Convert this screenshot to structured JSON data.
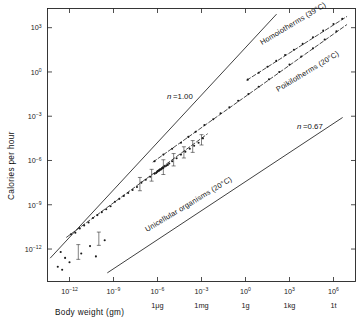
{
  "figure": {
    "name": "metabolic-rate-vs-body-weight-log-log-plot",
    "background_color": "#ffffff",
    "ink_color": "#1a1a1a"
  },
  "axes": {
    "x_title": "Body weight (gm)",
    "y_title": "Calories per hour",
    "x_tick_labels": [
      "10-12",
      "10-9",
      "10-6",
      "10-3",
      "100",
      "103",
      "106"
    ],
    "x_unit_labels": [
      "",
      "",
      "1μg",
      "1mg",
      "1g",
      "1kg",
      "1t"
    ],
    "y_tick_labels": [
      "103",
      "100",
      "10-3",
      "10-6",
      "10-9",
      "10-12"
    ]
  },
  "annotations": {
    "homoiotherms": "Homoiotherms (39°C)",
    "poikilotherms": "Poikilotherms (20°C)",
    "unicellular": "Unicellular organisms (20°C)",
    "slope_upper": "n =1.00",
    "slope_lower": "n =0.67"
  },
  "chart_data": {
    "type": "scatter",
    "title": "",
    "xlabel": "Body weight (gm)",
    "ylabel": "Calories per hour",
    "xscale": "log10",
    "yscale": "log10",
    "xlim": [
      -13.5,
      7.5
    ],
    "ylim": [
      -14.2,
      4.3
    ],
    "grid": false,
    "legend": "inline-annotations",
    "x_ticks": [
      -12,
      -9,
      -6,
      -3,
      0,
      3,
      6
    ],
    "x_tick_text": [
      "10^-12",
      "10^-9",
      "10^-6",
      "10^-3",
      "10^0",
      "10^3",
      "10^6"
    ],
    "x_secondary_text": [
      "",
      "",
      "1μg",
      "1mg",
      "1g",
      "1kg",
      "1t"
    ],
    "y_ticks": [
      3,
      0,
      -3,
      -6,
      -9,
      -12
    ],
    "y_tick_text": [
      "10^3",
      "10^0",
      "10^-3",
      "10^-6",
      "10^-9",
      "10^-12"
    ],
    "reference_lines": [
      {
        "name": "slope-1.00-reference",
        "label": "n =1.00",
        "slope": 1.0,
        "style": "solid",
        "points_log10": [
          [
            -13.3,
            -12.6
          ],
          [
            2.1,
            3.9
          ]
        ]
      },
      {
        "name": "slope-0.67-reference",
        "label": "n =0.67",
        "slope": 0.67,
        "style": "solid",
        "points_log10": [
          [
            -9.4,
            -13.6
          ],
          [
            6.6,
            -3.1
          ]
        ]
      }
    ],
    "series": [
      {
        "name": "Homoiotherms (39°C)",
        "temperature_C": 39,
        "slope": 0.73,
        "style": "dashed-with-points",
        "fit_log10": [
          [
            0.1,
            -0.55
          ],
          [
            6.9,
            3.75
          ]
        ],
        "points_log10": [
          [
            0.15,
            -0.52
          ],
          [
            0.9,
            -0.05
          ],
          [
            1.5,
            0.35
          ],
          [
            2.1,
            0.75
          ],
          [
            2.7,
            1.15
          ],
          [
            3.3,
            1.5
          ],
          [
            3.9,
            1.9
          ],
          [
            4.6,
            2.35
          ],
          [
            5.3,
            2.8
          ],
          [
            6.0,
            3.25
          ],
          [
            6.6,
            3.6
          ]
        ]
      },
      {
        "name": "Poikilotherms (20°C)",
        "temperature_C": 20,
        "slope": 0.73,
        "style": "dashed-with-points",
        "fit_log10": [
          [
            -6.3,
            -6.1
          ],
          [
            6.9,
            3.2
          ]
        ],
        "points_log10": [
          [
            -6.2,
            -6.05
          ],
          [
            -5.6,
            -5.6
          ],
          [
            -5.0,
            -5.2
          ],
          [
            -4.4,
            -4.8
          ],
          [
            -3.9,
            -4.4
          ],
          [
            -3.4,
            -4.05
          ],
          [
            -2.8,
            -3.6
          ],
          [
            -2.2,
            -3.2
          ],
          [
            -1.7,
            -2.8
          ],
          [
            -1.1,
            -2.4
          ],
          [
            -0.5,
            -1.95
          ],
          [
            0.2,
            -1.5
          ],
          [
            0.9,
            -1.0
          ],
          [
            1.6,
            -0.5
          ],
          [
            2.3,
            0.0
          ],
          [
            3.0,
            0.5
          ],
          [
            3.8,
            1.05
          ],
          [
            4.6,
            1.6
          ],
          [
            5.4,
            2.2
          ],
          [
            6.2,
            2.75
          ]
        ]
      },
      {
        "name": "Unicellular organisms (20°C)",
        "temperature_C": 20,
        "slope": 0.73,
        "style": "dashed-with-points",
        "fit_log10": [
          [
            -12.2,
            -11.2
          ],
          [
            -2.6,
            -4.2
          ]
        ],
        "points_log10": [
          [
            -11.9,
            -11.0
          ],
          [
            -11.6,
            -10.9
          ],
          [
            -11.3,
            -10.6
          ],
          [
            -11.0,
            -10.4
          ],
          [
            -10.7,
            -10.2
          ],
          [
            -10.4,
            -9.9
          ],
          [
            -10.1,
            -9.7
          ],
          [
            -9.8,
            -9.5
          ],
          [
            -9.5,
            -9.3
          ],
          [
            -9.2,
            -9.1
          ],
          [
            -8.9,
            -8.8
          ],
          [
            -8.6,
            -8.6
          ],
          [
            -8.3,
            -8.4
          ],
          [
            -8.0,
            -8.2
          ],
          [
            -7.7,
            -8.0
          ],
          [
            -7.4,
            -7.8
          ],
          [
            -7.1,
            -7.5
          ],
          [
            -6.8,
            -7.3
          ],
          [
            -6.5,
            -7.1
          ],
          [
            -6.2,
            -6.9
          ],
          [
            -6.1,
            -6.85
          ],
          [
            -6.05,
            -6.8
          ],
          [
            -6.0,
            -6.75
          ],
          [
            -5.95,
            -6.7
          ],
          [
            -5.9,
            -6.7
          ],
          [
            -5.85,
            -6.65
          ],
          [
            -5.8,
            -6.6
          ],
          [
            -5.75,
            -6.6
          ],
          [
            -5.7,
            -6.55
          ],
          [
            -5.65,
            -6.5
          ],
          [
            -5.6,
            -6.5
          ],
          [
            -5.5,
            -6.4
          ],
          [
            -5.4,
            -6.35
          ],
          [
            -5.3,
            -6.3
          ],
          [
            -5.2,
            -6.2
          ],
          [
            -5.0,
            -6.05
          ],
          [
            -4.7,
            -5.85
          ],
          [
            -4.4,
            -5.6
          ],
          [
            -4.1,
            -5.4
          ],
          [
            -3.8,
            -5.2
          ],
          [
            -3.5,
            -5.0
          ],
          [
            -3.2,
            -4.8
          ],
          [
            -2.9,
            -4.5
          ],
          [
            -12.6,
            -12.2
          ],
          [
            -12.3,
            -12.6
          ],
          [
            -12.0,
            -12.9
          ],
          [
            -11.2,
            -12.3
          ],
          [
            -10.6,
            -11.8
          ],
          [
            -10.2,
            -12.5
          ],
          [
            -9.6,
            -11.4
          ],
          [
            -12.8,
            -13.2
          ],
          [
            -12.5,
            -13.4
          ]
        ],
        "error_bars": [
          [
            -7.2,
            -7.6,
            0.45
          ],
          [
            -6.4,
            -7.0,
            0.4
          ],
          [
            -5.6,
            -6.45,
            0.5
          ],
          [
            -4.9,
            -5.95,
            0.42
          ],
          [
            -4.2,
            -5.45,
            0.38
          ],
          [
            -3.6,
            -5.05,
            0.4
          ],
          [
            -3.0,
            -4.6,
            0.35
          ],
          [
            -11.4,
            -12.2,
            0.5
          ],
          [
            -10.0,
            -11.3,
            0.45
          ]
        ]
      }
    ]
  }
}
